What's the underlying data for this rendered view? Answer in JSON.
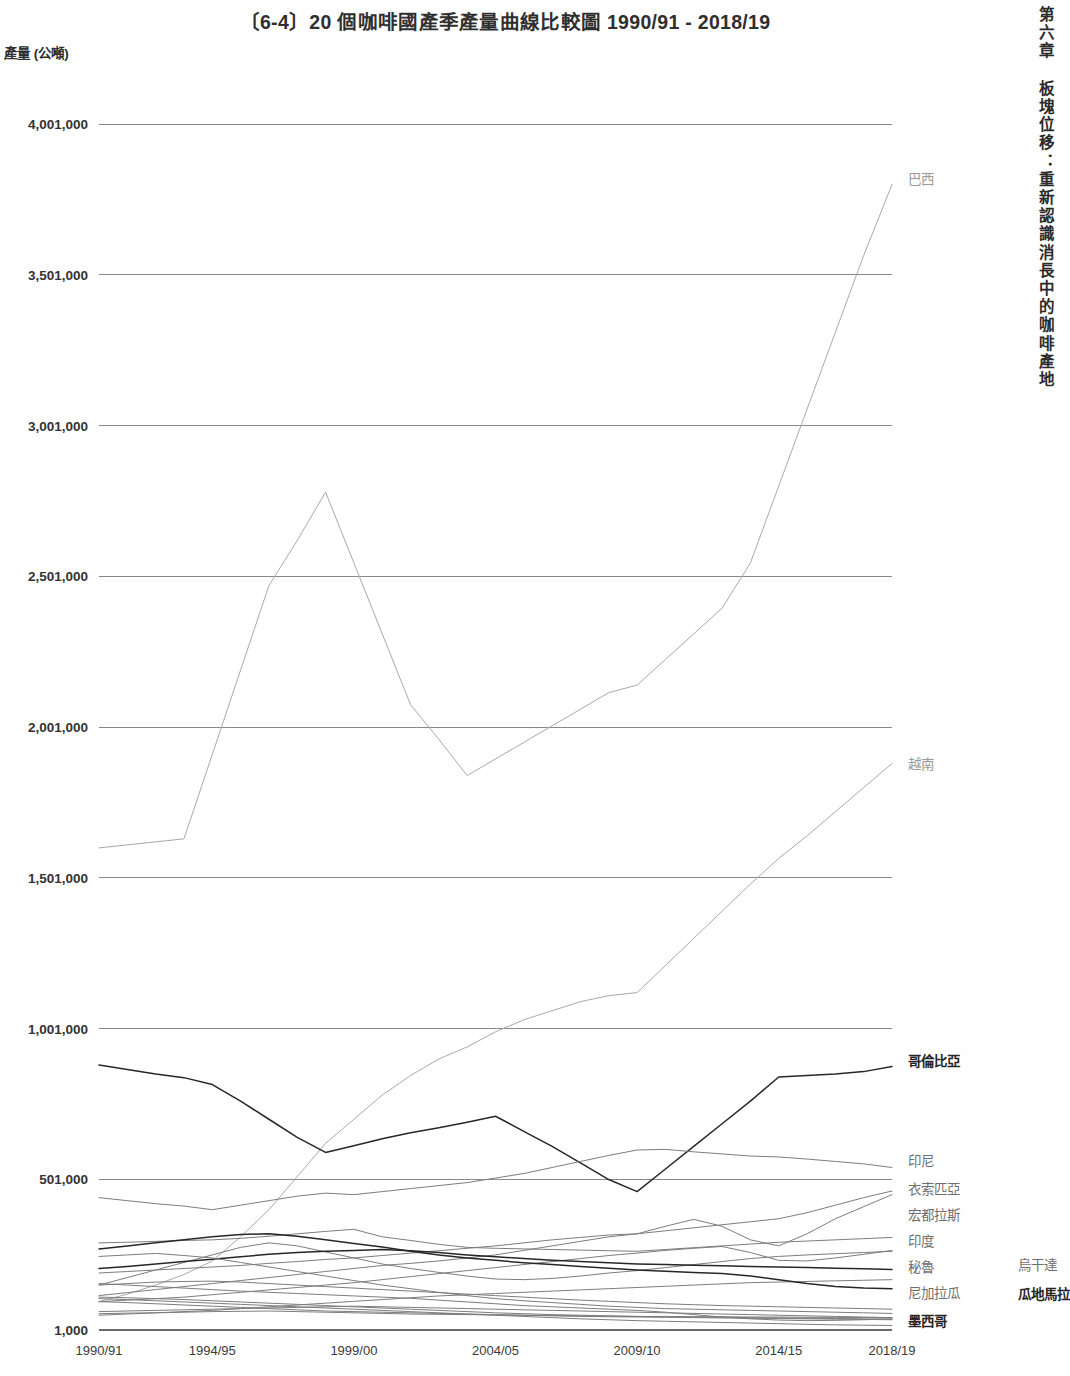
{
  "page": {
    "running_head": "第六章 板塊位移：重新認識消長中的咖啡產地"
  },
  "chart_data": {
    "type": "line",
    "title": "〔6-4〕20 個咖啡國產季產量曲線比較圖 1990/91 - 2018/19",
    "xlabel": "",
    "ylabel": "產量 (公噸)",
    "grid": true,
    "legend_position": "right-inline-end-labels",
    "ylim": [
      1000,
      4001000
    ],
    "ytick_labels": [
      "4,001,000",
      "3,501,000",
      "3,001,000",
      "2,501,000",
      "2,001,000",
      "1,501,000",
      "1,001,000",
      "501,000",
      "1,000"
    ],
    "ytick_values": [
      4001000,
      3501000,
      3001000,
      2501000,
      2001000,
      1501000,
      1001000,
      501000,
      1000
    ],
    "xtick_labels": [
      "1990/91",
      "1994/95",
      "1999/00",
      "2004/05",
      "2009/10",
      "2014/15",
      "2018/19"
    ],
    "xtick_values": [
      0,
      4,
      9,
      14,
      19,
      24,
      28
    ],
    "x": [
      0,
      1,
      2,
      3,
      4,
      5,
      6,
      7,
      8,
      9,
      10,
      11,
      12,
      13,
      14,
      15,
      16,
      17,
      18,
      19,
      20,
      21,
      22,
      23,
      24,
      25,
      26,
      27,
      28
    ],
    "x_season_labels": [
      "1990/91",
      "1991/92",
      "1992/93",
      "1993/94",
      "1994/95",
      "1995/96",
      "1996/97",
      "1997/98",
      "1998/99",
      "1999/00",
      "2000/01",
      "2001/02",
      "2002/03",
      "2003/04",
      "2004/05",
      "2005/06",
      "2006/07",
      "2007/08",
      "2008/09",
      "2009/10",
      "2010/11",
      "2011/12",
      "2012/13",
      "2013/14",
      "2014/15",
      "2015/16",
      "2016/17",
      "2017/18",
      "2018/19"
    ],
    "series": [
      {
        "name": "巴西",
        "label": "巴西",
        "emphasis": "faint",
        "label_y": 180,
        "values": [
          1600000,
          1610000,
          1620000,
          1630000,
          1910000,
          2190000,
          2470000,
          2620000,
          2780000,
          2545000,
          2310000,
          2075000,
          1960000,
          1840000,
          1895000,
          1950000,
          2005000,
          2060000,
          2115000,
          2140000,
          2225000,
          2310000,
          2395000,
          2545000,
          2800000,
          3055000,
          3310000,
          3565000,
          3800000
        ]
      },
      {
        "name": "越南",
        "label": "越南",
        "emphasis": "faint",
        "label_y": 765,
        "values": [
          95000,
          120000,
          150000,
          185000,
          230000,
          310000,
          400000,
          510000,
          620000,
          700000,
          780000,
          845000,
          900000,
          940000,
          990000,
          1030000,
          1060000,
          1090000,
          1110000,
          1120000,
          1210000,
          1300000,
          1390000,
          1480000,
          1565000,
          1640000,
          1720000,
          1800000,
          1880000
        ]
      },
      {
        "name": "哥倫比亞",
        "label": "哥倫比亞",
        "emphasis": "strong",
        "label_y": 1062,
        "values": [
          880000,
          865000,
          850000,
          838000,
          815000,
          760000,
          700000,
          640000,
          590000,
          612000,
          635000,
          655000,
          672000,
          690000,
          710000,
          660000,
          610000,
          555000,
          500000,
          460000,
          535000,
          610000,
          685000,
          760000,
          840000,
          845000,
          850000,
          858000,
          875000
        ]
      },
      {
        "name": "印尼",
        "label": "印尼",
        "emphasis": "mid",
        "label_y": 1162,
        "values": [
          440000,
          430000,
          420000,
          412000,
          400000,
          415000,
          430000,
          445000,
          455000,
          450000,
          460000,
          470000,
          480000,
          490000,
          505000,
          520000,
          540000,
          560000,
          580000,
          598000,
          600000,
          592000,
          585000,
          578000,
          575000,
          568000,
          560000,
          552000,
          540000
        ]
      },
      {
        "name": "衣索匹亞",
        "label": "衣索匹亞",
        "emphasis": "mid",
        "label_y": 1190,
        "values": [
          190000,
          195000,
          200000,
          205000,
          210000,
          215000,
          222000,
          228000,
          235000,
          240000,
          248000,
          256000,
          264000,
          272000,
          280000,
          290000,
          300000,
          308000,
          316000,
          320000,
          330000,
          340000,
          350000,
          360000,
          370000,
          390000,
          415000,
          440000,
          462000
        ]
      },
      {
        "name": "宏都拉斯",
        "label": "宏都拉斯",
        "emphasis": "mid",
        "label_y": 1216,
        "values": [
          115000,
          125000,
          135000,
          145000,
          155000,
          165000,
          175000,
          185000,
          195000,
          205000,
          215000,
          222000,
          230000,
          240000,
          250000,
          265000,
          280000,
          295000,
          310000,
          320000,
          345000,
          368000,
          345000,
          300000,
          280000,
          320000,
          370000,
          410000,
          450000
        ]
      },
      {
        "name": "印度",
        "label": "印度",
        "emphasis": "mid",
        "label_y": 1242,
        "values": [
          290000,
          292000,
          295000,
          298000,
          300000,
          305000,
          312000,
          320000,
          328000,
          335000,
          310000,
          298000,
          285000,
          275000,
          272000,
          270000,
          268000,
          266000,
          264000,
          262000,
          268000,
          274000,
          280000,
          286000,
          292000,
          296000,
          300000,
          304000,
          308000
        ]
      },
      {
        "name": "秘魯",
        "label": "秘魯",
        "emphasis": "mid",
        "label_y": 1268,
        "values": [
          95000,
          100000,
          105000,
          110000,
          118000,
          126000,
          134000,
          142000,
          150000,
          158000,
          168000,
          178000,
          188000,
          198000,
          208000,
          218000,
          228000,
          238000,
          248000,
          256000,
          265000,
          272000,
          278000,
          258000,
          232000,
          230000,
          240000,
          252000,
          265000
        ]
      },
      {
        "name": "烏干達",
        "label": "烏干達",
        "emphasis": "mid",
        "label_y": 1266,
        "label_x_offset": 110,
        "values": [
          150000,
          175000,
          200000,
          225000,
          250000,
          275000,
          290000,
          280000,
          260000,
          240000,
          220000,
          205000,
          192000,
          180000,
          170000,
          168000,
          172000,
          180000,
          190000,
          198000,
          208000,
          218000,
          228000,
          238000,
          245000,
          250000,
          254000,
          258000,
          262000
        ]
      },
      {
        "name": "尼加拉瓜",
        "label": "尼加拉瓜",
        "emphasis": "mid",
        "label_y": 1294,
        "values": [
          50000,
          54000,
          58000,
          62000,
          66000,
          72000,
          78000,
          84000,
          90000,
          96000,
          102000,
          108000,
          114000,
          118000,
          122000,
          126000,
          130000,
          134000,
          138000,
          142000,
          146000,
          150000,
          154000,
          158000,
          160000,
          162000,
          164000,
          166000,
          168000
        ]
      },
      {
        "name": "瓜地馬拉",
        "label": "瓜地馬拉",
        "emphasis": "strong",
        "label_y": 1295,
        "label_x_offset": 110,
        "values": [
          205000,
          212000,
          220000,
          228000,
          236000,
          244000,
          252000,
          258000,
          262000,
          265000,
          268000,
          264000,
          258000,
          250000,
          244000,
          238000,
          232000,
          228000,
          224000,
          220000,
          218000,
          216000,
          214000,
          212000,
          210000,
          208000,
          206000,
          204000,
          202000
        ]
      },
      {
        "name": "墨西哥",
        "label": "墨西哥",
        "emphasis": "strong",
        "label_y": 1322,
        "values": [
          270000,
          280000,
          290000,
          300000,
          310000,
          318000,
          320000,
          312000,
          300000,
          288000,
          276000,
          262000,
          250000,
          240000,
          232000,
          224000,
          218000,
          212000,
          206000,
          200000,
          196000,
          192000,
          188000,
          180000,
          168000,
          155000,
          145000,
          140000,
          138000
        ]
      },
      {
        "name": "象牙海岸",
        "label": "",
        "emphasis": "mid",
        "values": [
          245000,
          250000,
          255000,
          248000,
          240000,
          225000,
          210000,
          195000,
          180000,
          165000,
          150000,
          138000,
          126000,
          115000,
          105000,
          98000,
          92000,
          86000,
          80000,
          76000,
          72000,
          70000,
          68000,
          66000,
          64000,
          62000,
          60000,
          58000,
          56000
        ]
      },
      {
        "name": "哥斯大黎加",
        "label": "",
        "emphasis": "mid",
        "values": [
          150000,
          155000,
          160000,
          162000,
          163000,
          160000,
          155000,
          150000,
          145000,
          140000,
          135000,
          130000,
          125000,
          120000,
          115000,
          110000,
          105000,
          100000,
          96000,
          92000,
          88000,
          85000,
          82000,
          80000,
          78000,
          76000,
          74000,
          72000,
          70000
        ]
      },
      {
        "name": "薩爾瓦多",
        "label": "",
        "emphasis": "mid",
        "values": [
          155000,
          150000,
          145000,
          140000,
          135000,
          130000,
          126000,
          122000,
          118000,
          114000,
          110000,
          106000,
          100000,
          94000,
          88000,
          82000,
          78000,
          74000,
          70000,
          66000,
          60000,
          52000,
          44000,
          38000,
          34000,
          32000,
          33000,
          35000,
          38000
        ]
      },
      {
        "name": "喀麥隆",
        "label": "",
        "emphasis": "mid",
        "values": [
          110000,
          108000,
          105000,
          102000,
          98000,
          94000,
          90000,
          86000,
          82000,
          78000,
          74000,
          70000,
          66000,
          62000,
          58000,
          55000,
          52000,
          50000,
          48000,
          46000,
          45000,
          44000,
          43000,
          42000,
          41000,
          40000,
          39000,
          38000,
          37000
        ]
      },
      {
        "name": "巴布亞紐幾內亞",
        "label": "",
        "emphasis": "mid",
        "values": [
          62000,
          64000,
          66000,
          68000,
          70000,
          72000,
          74000,
          76000,
          78000,
          80000,
          78000,
          76000,
          74000,
          72000,
          70000,
          68000,
          66000,
          64000,
          62000,
          60000,
          58000,
          56000,
          54000,
          52000,
          50000,
          48000,
          46000,
          44000,
          42000
        ]
      },
      {
        "name": "肯亞",
        "label": "",
        "emphasis": "mid",
        "values": [
          95000,
          92000,
          88000,
          84000,
          80000,
          76000,
          72000,
          68000,
          64000,
          62000,
          60000,
          58000,
          56000,
          54000,
          52000,
          50000,
          48000,
          46000,
          45000,
          44000,
          43000,
          42000,
          41000,
          40000,
          39000,
          38000,
          37000,
          36000,
          35000
        ]
      },
      {
        "name": "坦尚尼亞",
        "label": "",
        "emphasis": "mid",
        "values": [
          55000,
          57000,
          58000,
          60000,
          62000,
          63000,
          64000,
          62000,
          60000,
          58000,
          56000,
          54000,
          53000,
          52000,
          51000,
          50000,
          49000,
          48000,
          47000,
          46000,
          46000,
          45000,
          45000,
          44000,
          44000,
          43000,
          43000,
          42000,
          42000
        ]
      },
      {
        "name": "厄瓜多",
        "label": "",
        "emphasis": "mid",
        "values": [
          105000,
          102000,
          98000,
          94000,
          90000,
          86000,
          82000,
          78000,
          74000,
          70000,
          66000,
          62000,
          58000,
          54000,
          50000,
          46000,
          42000,
          38000,
          35000,
          32000,
          30000,
          28000,
          26000,
          24000,
          22000,
          20000,
          18000,
          17000,
          16000
        ]
      }
    ]
  }
}
